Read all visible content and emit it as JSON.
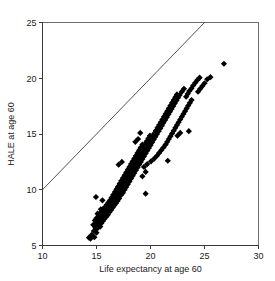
{
  "chart_data": {
    "type": "scatter",
    "title": "",
    "subtitle": "",
    "xlabel": "Life expectancy at age 60",
    "ylabel": "HALE at age 60",
    "xlim": [
      10,
      30
    ],
    "ylim": [
      5,
      25
    ],
    "xticks": [
      10,
      15,
      20,
      25,
      30
    ],
    "yticks": [
      5,
      10,
      15,
      20,
      25
    ],
    "xtick_labels": [
      "10",
      "15",
      "20",
      "25",
      "30"
    ],
    "ytick_labels": [
      "5",
      "10",
      "15",
      "20",
      "25"
    ],
    "grid": false,
    "legend": null,
    "legend_position": "none",
    "marker_shape": "diamond",
    "marker_color": "#000000",
    "marker_size": 3.1,
    "annotations": [],
    "reference_line": {
      "name": "identity-line",
      "description": "y = x diagonal reference line",
      "x": [
        10,
        25
      ],
      "y": [
        10,
        25
      ],
      "color": "#3f3f3f"
    },
    "series": [
      {
        "name": "countries",
        "marker": "diamond",
        "color": "#000000",
        "points": [
          [
            14.3,
            5.7
          ],
          [
            14.45,
            5.62
          ],
          [
            14.55,
            5.95
          ],
          [
            14.8,
            5.75
          ],
          [
            14.75,
            6.3
          ],
          [
            15.0,
            6.15
          ],
          [
            14.9,
            6.6
          ],
          [
            15.1,
            6.55
          ],
          [
            14.7,
            6.85
          ],
          [
            14.95,
            6.9
          ],
          [
            15.2,
            6.8
          ],
          [
            15.35,
            6.7
          ],
          [
            15.05,
            7.1
          ],
          [
            15.25,
            7.05
          ],
          [
            15.45,
            7.0
          ],
          [
            14.85,
            7.25
          ],
          [
            15.15,
            7.3
          ],
          [
            15.4,
            7.25
          ],
          [
            15.6,
            7.2
          ],
          [
            15.0,
            7.45
          ],
          [
            15.3,
            7.5
          ],
          [
            15.55,
            7.45
          ],
          [
            15.75,
            7.4
          ],
          [
            15.2,
            7.65
          ],
          [
            15.45,
            7.7
          ],
          [
            15.7,
            7.62
          ],
          [
            15.9,
            7.58
          ],
          [
            15.1,
            7.85
          ],
          [
            15.35,
            7.9
          ],
          [
            15.6,
            7.85
          ],
          [
            15.85,
            7.8
          ],
          [
            16.05,
            7.75
          ],
          [
            15.5,
            8.05
          ],
          [
            15.75,
            8.1
          ],
          [
            16.0,
            8.05
          ],
          [
            16.2,
            8.0
          ],
          [
            15.4,
            8.25
          ],
          [
            15.65,
            8.3
          ],
          [
            15.9,
            8.28
          ],
          [
            16.15,
            8.22
          ],
          [
            16.35,
            8.18
          ],
          [
            15.8,
            8.45
          ],
          [
            16.05,
            8.5
          ],
          [
            16.3,
            8.45
          ],
          [
            16.5,
            8.4
          ],
          [
            15.95,
            8.65
          ],
          [
            16.2,
            8.7
          ],
          [
            16.45,
            8.65
          ],
          [
            16.65,
            8.6
          ],
          [
            16.1,
            8.85
          ],
          [
            16.35,
            8.9
          ],
          [
            16.6,
            8.85
          ],
          [
            16.8,
            8.8
          ],
          [
            15.55,
            9.05
          ],
          [
            16.25,
            9.05
          ],
          [
            16.5,
            9.1
          ],
          [
            16.75,
            9.05
          ],
          [
            16.95,
            9.0
          ],
          [
            14.95,
            9.35
          ],
          [
            16.4,
            9.3
          ],
          [
            16.65,
            9.35
          ],
          [
            16.9,
            9.28
          ],
          [
            17.1,
            9.22
          ],
          [
            16.55,
            9.55
          ],
          [
            16.8,
            9.6
          ],
          [
            17.05,
            9.55
          ],
          [
            17.25,
            9.5
          ],
          [
            16.7,
            9.8
          ],
          [
            16.95,
            9.85
          ],
          [
            17.2,
            9.8
          ],
          [
            17.45,
            9.72
          ],
          [
            19.55,
            9.65
          ],
          [
            16.85,
            10.05
          ],
          [
            17.1,
            10.1
          ],
          [
            17.35,
            10.05
          ],
          [
            17.6,
            10.0
          ],
          [
            17.0,
            10.3
          ],
          [
            17.25,
            10.35
          ],
          [
            17.5,
            10.3
          ],
          [
            17.75,
            10.25
          ],
          [
            17.15,
            10.55
          ],
          [
            17.4,
            10.6
          ],
          [
            17.65,
            10.55
          ],
          [
            17.9,
            10.5
          ],
          [
            17.3,
            10.8
          ],
          [
            17.55,
            10.85
          ],
          [
            17.8,
            10.8
          ],
          [
            18.05,
            10.75
          ],
          [
            17.45,
            11.05
          ],
          [
            17.7,
            11.1
          ],
          [
            17.95,
            11.05
          ],
          [
            18.2,
            11.0
          ],
          [
            17.6,
            11.3
          ],
          [
            17.85,
            11.35
          ],
          [
            18.1,
            11.3
          ],
          [
            18.35,
            11.25
          ],
          [
            19.25,
            11.2
          ],
          [
            17.75,
            11.55
          ],
          [
            18.0,
            11.6
          ],
          [
            18.25,
            11.55
          ],
          [
            18.5,
            11.5
          ],
          [
            19.55,
            11.6
          ],
          [
            17.9,
            11.8
          ],
          [
            18.15,
            11.85
          ],
          [
            18.4,
            11.8
          ],
          [
            18.65,
            11.75
          ],
          [
            18.05,
            12.05
          ],
          [
            18.3,
            12.1
          ],
          [
            18.55,
            12.05
          ],
          [
            18.8,
            12.0
          ],
          [
            19.4,
            12.05
          ],
          [
            17.05,
            12.25
          ],
          [
            18.2,
            12.3
          ],
          [
            18.45,
            12.35
          ],
          [
            18.7,
            12.3
          ],
          [
            18.95,
            12.25
          ],
          [
            19.7,
            12.3
          ],
          [
            17.35,
            12.5
          ],
          [
            18.35,
            12.55
          ],
          [
            18.6,
            12.6
          ],
          [
            18.85,
            12.55
          ],
          [
            19.1,
            12.5
          ],
          [
            20.05,
            12.55
          ],
          [
            21.6,
            12.6
          ],
          [
            18.5,
            12.8
          ],
          [
            18.75,
            12.85
          ],
          [
            19.0,
            12.8
          ],
          [
            19.25,
            12.75
          ],
          [
            20.35,
            12.8
          ],
          [
            18.65,
            13.05
          ],
          [
            18.9,
            13.1
          ],
          [
            19.15,
            13.05
          ],
          [
            19.4,
            13.0
          ],
          [
            20.6,
            13.05
          ],
          [
            18.8,
            13.3
          ],
          [
            19.05,
            13.35
          ],
          [
            19.3,
            13.3
          ],
          [
            19.55,
            13.25
          ],
          [
            20.8,
            13.3
          ],
          [
            18.95,
            13.55
          ],
          [
            19.2,
            13.6
          ],
          [
            19.45,
            13.55
          ],
          [
            19.7,
            13.5
          ],
          [
            21.0,
            13.55
          ],
          [
            19.1,
            13.8
          ],
          [
            19.35,
            13.85
          ],
          [
            19.6,
            13.8
          ],
          [
            19.85,
            13.75
          ],
          [
            21.2,
            13.8
          ],
          [
            19.25,
            14.05
          ],
          [
            19.5,
            14.1
          ],
          [
            19.75,
            14.05
          ],
          [
            20.0,
            14.0
          ],
          [
            21.4,
            14.05
          ],
          [
            18.6,
            14.3
          ],
          [
            19.65,
            14.35
          ],
          [
            19.9,
            14.3
          ],
          [
            20.15,
            14.25
          ],
          [
            21.55,
            14.3
          ],
          [
            18.85,
            14.55
          ],
          [
            19.8,
            14.6
          ],
          [
            20.05,
            14.55
          ],
          [
            20.3,
            14.5
          ],
          [
            21.7,
            14.55
          ],
          [
            19.95,
            14.85
          ],
          [
            20.2,
            14.8
          ],
          [
            20.45,
            14.75
          ],
          [
            21.85,
            14.8
          ],
          [
            22.5,
            14.85
          ],
          [
            19.05,
            15.1
          ],
          [
            20.35,
            15.05
          ],
          [
            20.6,
            15.0
          ],
          [
            22.0,
            15.05
          ],
          [
            22.75,
            15.1
          ],
          [
            20.5,
            15.3
          ],
          [
            20.75,
            15.25
          ],
          [
            22.15,
            15.3
          ],
          [
            23.55,
            15.25
          ],
          [
            20.65,
            15.55
          ],
          [
            20.9,
            15.5
          ],
          [
            22.3,
            15.55
          ],
          [
            20.8,
            15.8
          ],
          [
            21.05,
            15.75
          ],
          [
            22.45,
            15.8
          ],
          [
            20.95,
            16.05
          ],
          [
            21.2,
            16.0
          ],
          [
            22.6,
            16.05
          ],
          [
            21.1,
            16.3
          ],
          [
            21.35,
            16.25
          ],
          [
            22.75,
            16.3
          ],
          [
            21.25,
            16.55
          ],
          [
            21.5,
            16.5
          ],
          [
            22.9,
            16.55
          ],
          [
            21.4,
            16.8
          ],
          [
            21.65,
            16.75
          ],
          [
            23.05,
            16.8
          ],
          [
            21.55,
            17.05
          ],
          [
            21.8,
            17.0
          ],
          [
            23.2,
            17.05
          ],
          [
            21.7,
            17.3
          ],
          [
            21.95,
            17.25
          ],
          [
            23.35,
            17.3
          ],
          [
            21.85,
            17.55
          ],
          [
            22.1,
            17.5
          ],
          [
            23.5,
            17.55
          ],
          [
            22.0,
            17.8
          ],
          [
            22.25,
            17.75
          ],
          [
            23.65,
            17.8
          ],
          [
            22.15,
            18.05
          ],
          [
            22.4,
            18.0
          ],
          [
            23.8,
            18.05
          ],
          [
            22.3,
            18.3
          ],
          [
            22.55,
            18.25
          ],
          [
            23.3,
            18.35
          ],
          [
            22.45,
            18.55
          ],
          [
            22.7,
            18.5
          ],
          [
            23.45,
            18.6
          ],
          [
            22.9,
            18.8
          ],
          [
            23.6,
            18.85
          ],
          [
            24.4,
            18.8
          ],
          [
            23.1,
            19.05
          ],
          [
            23.8,
            19.1
          ],
          [
            24.6,
            19.05
          ],
          [
            23.95,
            19.35
          ],
          [
            24.8,
            19.3
          ],
          [
            24.15,
            19.6
          ],
          [
            25.0,
            19.55
          ],
          [
            24.35,
            19.85
          ],
          [
            25.25,
            19.9
          ],
          [
            24.55,
            20.05
          ],
          [
            25.55,
            20.1
          ],
          [
            26.8,
            21.3
          ]
        ]
      }
    ]
  }
}
